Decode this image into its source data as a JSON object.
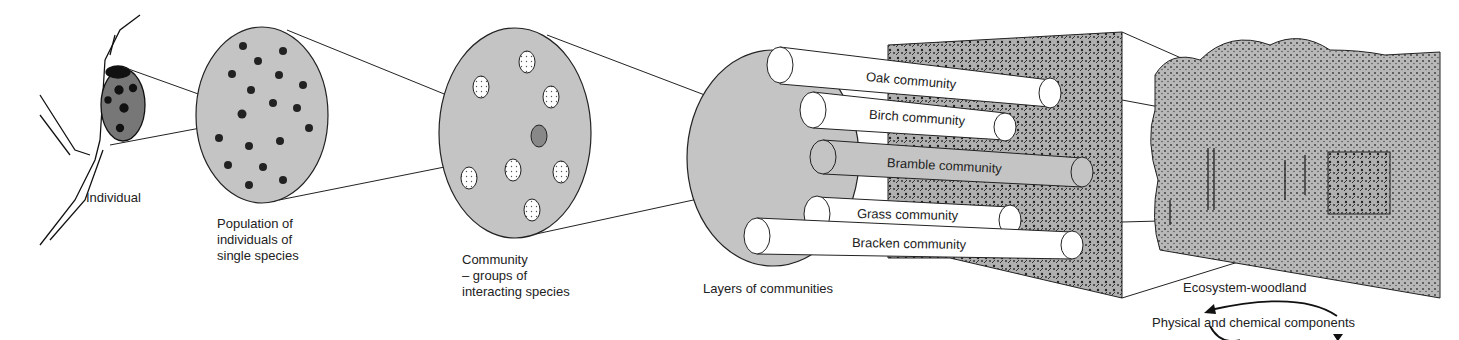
{
  "colors": {
    "circle_fill": "#c4c4c4",
    "bramble_fill": "#c4c4c4",
    "line": "#222222",
    "background": "#ffffff"
  },
  "stages": {
    "individual": {
      "label": "Individual"
    },
    "population": {
      "label": "Population of\nindividuals of\nsingle species"
    },
    "community": {
      "label": "Community\n– groups of\ninteracting species"
    },
    "layers": {
      "label": "Layers of communities"
    },
    "ecosystem": {
      "label": "Ecosystem-woodland"
    },
    "components": {
      "label": "Physical and chemical components"
    }
  },
  "communities": [
    {
      "label": "Oak community",
      "shaded": false
    },
    {
      "label": "Birch community",
      "shaded": false
    },
    {
      "label": "Bramble community",
      "shaded": true
    },
    {
      "label": "Grass community",
      "shaded": false
    },
    {
      "label": "Bracken community",
      "shaded": false
    }
  ]
}
